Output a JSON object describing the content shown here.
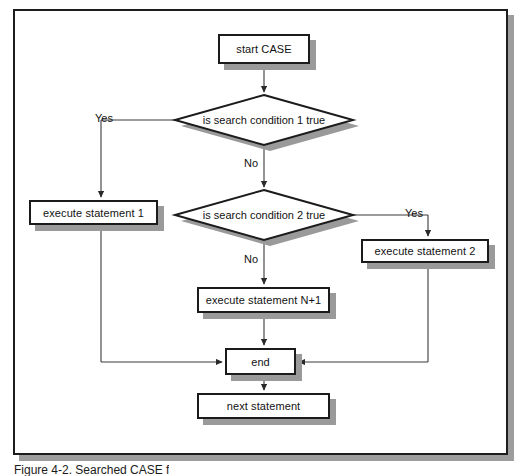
{
  "figure": {
    "caption": "Figure 4-2.  Searched CASE f",
    "frame_color": "#1d1d1d",
    "shadow_color": "#9d9d9d"
  },
  "diagram": {
    "type": "flowchart",
    "nodes": [
      {
        "id": "start",
        "kind": "process",
        "label": "start CASE"
      },
      {
        "id": "cond1",
        "kind": "decision",
        "label": "is search condition 1 true"
      },
      {
        "id": "stmt1",
        "kind": "process",
        "label": "execute statement 1"
      },
      {
        "id": "cond2",
        "kind": "decision",
        "label": "is search condition 2 true"
      },
      {
        "id": "stmt2",
        "kind": "process",
        "label": "execute statement 2"
      },
      {
        "id": "stmtN",
        "kind": "process",
        "label": "execute statement N+1"
      },
      {
        "id": "end",
        "kind": "process",
        "label": "end"
      },
      {
        "id": "next",
        "kind": "process",
        "label": "next statement"
      }
    ],
    "edges": [
      {
        "from": "start",
        "to": "cond1",
        "label": ""
      },
      {
        "from": "cond1",
        "to": "stmt1",
        "label": "Yes"
      },
      {
        "from": "cond1",
        "to": "cond2",
        "label": "No"
      },
      {
        "from": "cond2",
        "to": "stmt2",
        "label": "Yes"
      },
      {
        "from": "cond2",
        "to": "stmtN",
        "label": "No"
      },
      {
        "from": "stmt1",
        "to": "end",
        "label": ""
      },
      {
        "from": "stmt2",
        "to": "end",
        "label": ""
      },
      {
        "from": "stmtN",
        "to": "end",
        "label": ""
      },
      {
        "from": "end",
        "to": "next",
        "label": ""
      }
    ],
    "edge_labels": {
      "yes_left": "Yes",
      "no_first": "No",
      "yes_right": "Yes",
      "no_second": "No"
    }
  },
  "colors": {
    "stroke": "#1b1b1b",
    "fill": "#ffffff",
    "shadow": "#9a9a9a",
    "wire": "#3a3a3a"
  }
}
